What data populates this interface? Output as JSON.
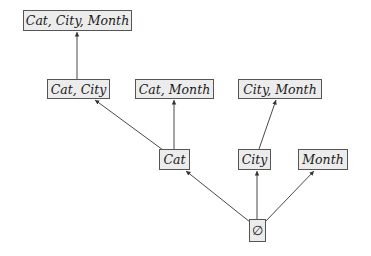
{
  "diagram": {
    "type": "cuboid-lattice",
    "nodes": [
      {
        "id": "cat_city_month",
        "label": "Cat, City, Month",
        "box": [
          23,
          10,
          109,
          21
        ]
      },
      {
        "id": "cat_city",
        "label": "Cat, City",
        "box": [
          47,
          79,
          63,
          20
        ]
      },
      {
        "id": "cat_month",
        "label": "Cat, Month",
        "box": [
          135,
          79,
          79,
          20
        ]
      },
      {
        "id": "city_month",
        "label": "City, Month",
        "box": [
          238,
          79,
          84,
          20
        ]
      },
      {
        "id": "cat",
        "label": "Cat",
        "box": [
          159,
          149,
          31,
          21
        ]
      },
      {
        "id": "city",
        "label": "City",
        "box": [
          238,
          149,
          33,
          21
        ]
      },
      {
        "id": "month",
        "label": "Month",
        "box": [
          298,
          149,
          50,
          21
        ]
      },
      {
        "id": "empty",
        "label": "∅",
        "box": [
          249,
          219,
          17,
          23
        ]
      }
    ],
    "edges": [
      {
        "from": "cat_city",
        "to": "cat_city_month"
      },
      {
        "from": "cat",
        "to": "cat_city"
      },
      {
        "from": "cat",
        "to": "cat_month"
      },
      {
        "from": "city",
        "to": "city_month"
      },
      {
        "from": "empty",
        "to": "cat"
      },
      {
        "from": "empty",
        "to": "city"
      },
      {
        "from": "empty",
        "to": "month"
      }
    ],
    "colors": {
      "node_fill": "#ececec",
      "node_border": "#555555",
      "edge": "#333333"
    }
  }
}
